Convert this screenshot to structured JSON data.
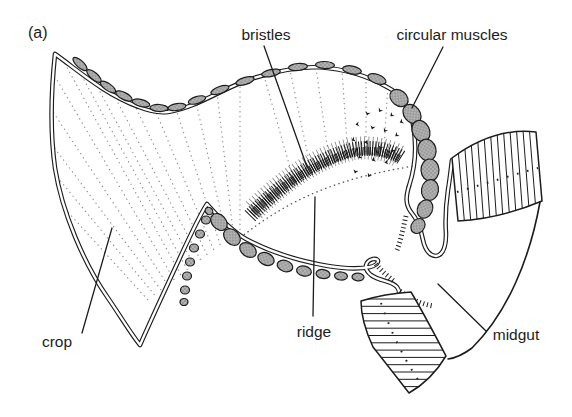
{
  "figure": {
    "panel_label": "(a)",
    "type": "anatomical line diagram (insect foregut/midgut section)",
    "background": "#ffffff",
    "colors": {
      "ink": "#1c1c1c",
      "muscle_fill": "#b4b4b4",
      "muscle_dot": "#6b6b6b",
      "dotted_striation": "#8a8a8a",
      "bristle": "#1b1b1b"
    },
    "labels": {
      "bristles": "bristles",
      "circular_muscles": "circular muscles",
      "crop": "crop",
      "ridge": "ridge",
      "midgut": "midgut"
    },
    "parts": [
      {
        "name": "crop",
        "description": "large thin-walled pouch, left"
      },
      {
        "name": "bristles",
        "description": "dark brush-like crescent inside crop"
      },
      {
        "name": "circular muscles",
        "description": "grey stippled segments along crop wall"
      },
      {
        "name": "ridge",
        "description": "mound under bristle band"
      },
      {
        "name": "midgut",
        "description": "striated tube, lower right"
      }
    ]
  }
}
